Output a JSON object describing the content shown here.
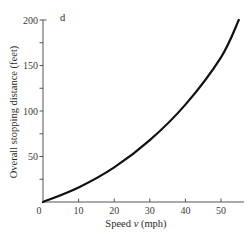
{
  "chart_data": {
    "type": "line",
    "title": "",
    "xlabel": "Speed v (mph)",
    "ylabel": "Overall stopping distance (feet)",
    "y_axis_variable": "d",
    "xlim": [
      0,
      56
    ],
    "ylim": [
      0,
      200
    ],
    "x_ticks": [
      0,
      10,
      20,
      30,
      40,
      50
    ],
    "x_tick_labels": [
      "0",
      "10",
      "20",
      "30",
      "40",
      "50"
    ],
    "y_ticks": [
      0,
      25,
      50,
      75,
      100,
      125,
      150,
      175,
      200
    ],
    "y_tick_labels": [
      "",
      "",
      "50",
      "",
      "100",
      "",
      "150",
      "",
      "200"
    ],
    "grid": false,
    "legend": null,
    "series": [
      {
        "name": "d",
        "x": [
          0,
          10,
          20,
          30,
          40,
          50,
          55
        ],
        "y": [
          0,
          16,
          38,
          68,
          107,
          159,
          200
        ]
      }
    ]
  },
  "labels": {
    "xlabel_prefix": "Speed ",
    "xlabel_var": "v",
    "xlabel_suffix": " (mph)",
    "ylabel": "Overall stopping distance (feet)",
    "y_var": "d"
  }
}
